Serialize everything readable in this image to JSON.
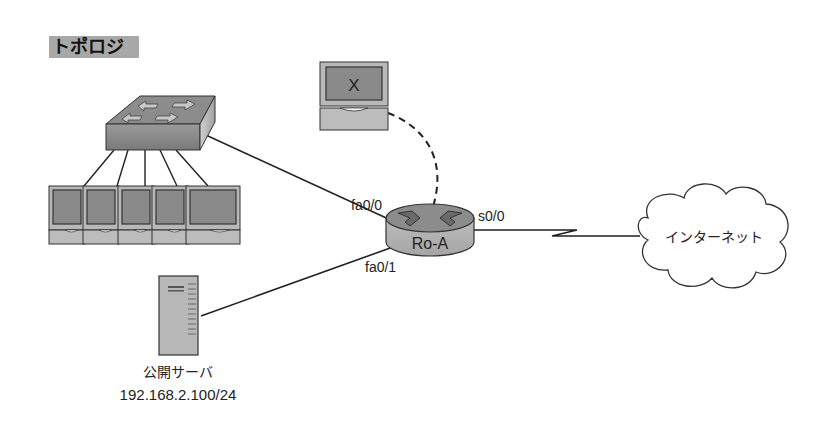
{
  "title": "トポロジ",
  "colors": {
    "title_bg": "#a8a8a8",
    "device_fill": "#b4b4b4",
    "screen_fill": "#8a8a8a",
    "line": "#222222",
    "background": "#ffffff"
  },
  "nodes": {
    "switch": {
      "label": ""
    },
    "pcs": {
      "count": 5
    },
    "admin_pc": {
      "screen_label": "X"
    },
    "router": {
      "label": "Ro-A"
    },
    "server": {
      "label": "公開サーバ",
      "ip": "192.168.2.100/24"
    },
    "internet": {
      "label": "インターネット"
    }
  },
  "interfaces": {
    "fa00": "fa0/0",
    "fa01": "fa0/1",
    "s00": "s0/0"
  },
  "links": [
    {
      "from": "switch",
      "to": "router",
      "interface": "fa0/0",
      "style": "solid"
    },
    {
      "from": "server",
      "to": "router",
      "interface": "fa0/1",
      "style": "solid"
    },
    {
      "from": "admin_pc",
      "to": "router",
      "style": "dashed"
    },
    {
      "from": "router",
      "to": "internet",
      "interface": "s0/0",
      "style": "serial"
    },
    {
      "from": "switch",
      "to": "pcs",
      "count": 5,
      "style": "solid"
    }
  ]
}
